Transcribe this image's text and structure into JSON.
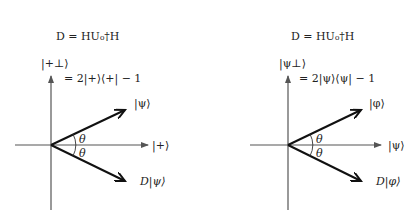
{
  "left": {
    "equation": {
      "line1": "D = HU₀†H",
      "line2": "= 2|+⟩⟨+| − 1"
    },
    "labels": {
      "vertical_axis": "|+⊥⟩",
      "horizontal_axis": "|+⟩",
      "upper_vector": "|ψ⟩",
      "lower_vector": "D|ψ⟩",
      "angle_upper": "θ",
      "angle_lower": "θ"
    }
  },
  "right": {
    "equation": {
      "line1": "D = HU₀†H",
      "line2": "= 2|ψ⟩⟨ψ| − 1"
    },
    "labels": {
      "vertical_axis": "|ψ⊥⟩",
      "horizontal_axis": "|ψ⟩",
      "upper_vector": "|φ⟩",
      "lower_vector": "D|φ⟩",
      "angle_upper": "θ",
      "angle_lower": "θ"
    }
  },
  "colors": {
    "axis": "#555555",
    "vector": "#111111"
  }
}
